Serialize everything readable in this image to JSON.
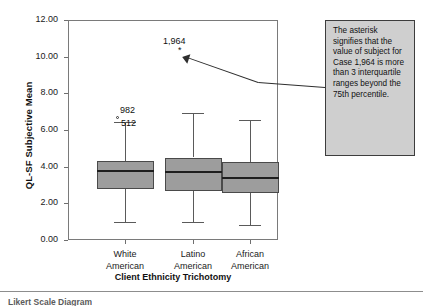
{
  "chart_data": {
    "type": "box",
    "title": "",
    "xlabel": "Client Ethnicity Trichotomy",
    "ylabel": "QL-SF Subjective Mean",
    "ylim": [
      0.0,
      12.0
    ],
    "ytick_labels": [
      "0.00",
      "2.00",
      "4.00",
      "6.00",
      "8.00",
      "10.00",
      "12.00"
    ],
    "ytick_values": [
      0.0,
      2.0,
      4.0,
      6.0,
      8.0,
      10.0,
      12.0
    ],
    "grid": false,
    "legend": "none",
    "categories": [
      "White American",
      "Latino American",
      "African American"
    ],
    "category_lines": [
      [
        "White",
        "American"
      ],
      [
        "Latino",
        "American"
      ],
      [
        "African",
        "American"
      ]
    ],
    "boxes": [
      {
        "category": "White American",
        "whisker_low": 1.0,
        "q1": 2.8,
        "median": 3.75,
        "q3": 4.3,
        "whisker_high": 6.45
      },
      {
        "category": "Latino American",
        "whisker_low": 1.0,
        "q1": 2.7,
        "median": 3.7,
        "q3": 4.5,
        "whisker_high": 6.95
      },
      {
        "category": "African American",
        "whisker_low": 0.8,
        "q1": 2.55,
        "median": 3.4,
        "q3": 4.25,
        "whisker_high": 6.55
      }
    ],
    "outliers": [
      {
        "label": "982",
        "marker": "circle",
        "category": "White American",
        "value": 6.7
      },
      {
        "label": "512",
        "marker": "whisker-cap-label",
        "category": "White American",
        "value": 6.45
      },
      {
        "label": "1,964",
        "marker": "asterisk",
        "category": "Latino American",
        "value": 10.55
      }
    ]
  },
  "annotation": {
    "text": "The asterisk signifies that the value of subject for Case 1,964 is more than 3 interquartile ranges beyond the 75th percentile.",
    "background": "#cfcfcf",
    "border": "#3d3d3d"
  },
  "caption": {
    "text": "Likert Scale Diagram"
  },
  "style": {
    "box_fill": "#9d9d9d",
    "box_edge": "#4a4a4a",
    "median_color": "#1e1e1e",
    "whisker_color": "#5a5a5a",
    "frame_color": "#7a7a7a",
    "text_color": "#1a1a1a"
  }
}
